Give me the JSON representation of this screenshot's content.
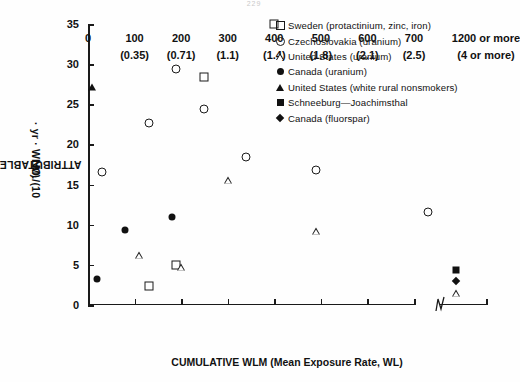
{
  "top_code": "229",
  "chart_data": {
    "type": "scatter",
    "title": "",
    "xlabel": "CUMULATIVE WLM (Mean Exposure Rate, WL)",
    "ylabel": "ATTRIBUTABLE LUNG CANCERS, NO./(10⁶ · yr · WLM)",
    "ylabel_line1": "ATTRIBUTABLE LUNG CANCERS,",
    "ylabel_line2_pre": "NO./(10",
    "ylabel_line2_sup": "6",
    "ylabel_line2_post": " · yr · WLM)",
    "ylim": [
      0,
      35
    ],
    "yticks": [
      0,
      5,
      10,
      15,
      20,
      25,
      30,
      35
    ],
    "ytick_labels": [
      "0",
      "5",
      "10",
      "15",
      "20",
      "25",
      "30",
      "35"
    ],
    "xlim": [
      0,
      700
    ],
    "xticks": [
      0,
      100,
      200,
      300,
      400,
      500,
      600,
      700
    ],
    "xtick_labels": [
      "0",
      "100",
      "200",
      "300",
      "400",
      "500",
      "600",
      "700"
    ],
    "xtick_labels_secondary": [
      "",
      "(0.35)",
      "(0.71)",
      "(1.1)",
      "(1.4)",
      "(1.8)",
      "(2.1)",
      "(2.5)"
    ],
    "axis_break": true,
    "break_tick_label": "1200 or more",
    "break_tick_label_secondary": "(4 or more)",
    "grid": false,
    "legend_position": "upper right",
    "series": [
      {
        "name": "Sweden (protactinium, zinc, iron)",
        "marker": "open-square",
        "points": [
          [
            130,
            2.4
          ],
          [
            190,
            5.0
          ],
          [
            250,
            28.4
          ],
          [
            400,
            35.0
          ]
        ]
      },
      {
        "name": "Czechoslovakia (uranium)",
        "marker": "open-circle",
        "points": [
          [
            30,
            16.6
          ],
          [
            130,
            22.7
          ],
          [
            190,
            29.4
          ],
          [
            250,
            24.4
          ],
          [
            340,
            18.4
          ],
          [
            490,
            16.8
          ],
          [
            730,
            11.6
          ]
        ]
      },
      {
        "name": "United States (uranium)",
        "marker": "open-triangle",
        "points": [
          [
            110,
            6.2
          ],
          [
            200,
            5.6
          ],
          [
            300,
            17.3
          ],
          [
            490,
            11.8
          ],
          [
            1200,
            5.0
          ]
        ]
      },
      {
        "name": "Canada (uranium)",
        "marker": "filled-circle",
        "points": [
          [
            20,
            3.3
          ],
          [
            80,
            9.4
          ],
          [
            180,
            11.0
          ]
        ]
      },
      {
        "name": "United States (white rural nonsmokers)",
        "marker": "filled-triangle",
        "points": [
          [
            8,
            27.1
          ]
        ]
      },
      {
        "name": "Schneeburg—Joachimsthal",
        "marker": "filled-square",
        "points": [
          [
            1200,
            4.4
          ]
        ]
      },
      {
        "name": "Canada (fluorspar)",
        "marker": "filled-diamond",
        "points": [
          [
            1200,
            3.0
          ]
        ]
      }
    ]
  },
  "legend": {
    "entries": [
      {
        "marker": "open-square",
        "label": "Sweden (protactinium, zinc, iron)"
      },
      {
        "marker": "open-circle",
        "label": "Czechoslovakia (uranium)"
      },
      {
        "marker": "open-triangle",
        "label": "United States (uranium)"
      },
      {
        "marker": "filled-circle",
        "label": "Canada (uranium)"
      },
      {
        "marker": "filled-triangle",
        "label": "United States (white rural nonsmokers)"
      },
      {
        "marker": "filled-square",
        "label": "Schneeburg—Joachimsthal"
      },
      {
        "marker": "filled-diamond",
        "label": "Canada (fluorspar)"
      }
    ]
  }
}
